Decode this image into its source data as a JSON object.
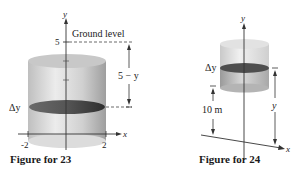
{
  "figures": [
    {
      "id": "fig23",
      "caption": "Figure for 23",
      "axes": {
        "x_label": "x",
        "y_label": "y"
      },
      "ticks": {
        "x": [
          "-2",
          "2"
        ],
        "y": [
          "5"
        ]
      },
      "labels": {
        "ground": "Ground level",
        "distance": "5 − y",
        "slice": "Δy"
      }
    },
    {
      "id": "fig24",
      "caption": "Figure for 24",
      "axes": {
        "x_label": "x",
        "y_label": "y"
      },
      "labels": {
        "slice": "Δy",
        "height": "10 m",
        "distance": "y"
      }
    }
  ],
  "colors": {
    "cylinder_light": "#e4e4e4",
    "cylinder_mid": "#bdbdbd",
    "slice_dark": "#4a4a4a",
    "axis": "#333333",
    "text": "#222222"
  }
}
